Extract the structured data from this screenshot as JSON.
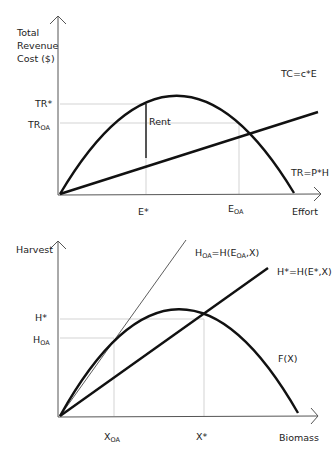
{
  "top_chart": {
    "y_axis_label": [
      "Total",
      "Revenue",
      "Cost ($)"
    ],
    "x_axis_label": "Effort",
    "y_ticks": {
      "tr_star": "TR*",
      "tr_oa_base": "TR",
      "tr_oa_sub": "OA"
    },
    "x_ticks": {
      "e_star": "E*",
      "e_oa_base": "E",
      "e_oa_sub": "OA"
    },
    "curve_labels": {
      "tc": "TC=c*E",
      "tr": "TR=P*H",
      "rent": "Rent"
    }
  },
  "bottom_chart": {
    "y_axis_label": "Harvest",
    "x_axis_label": "Biomass",
    "y_ticks": {
      "h_star": "H*",
      "h_oa_base": "H",
      "h_oa_sub": "OA"
    },
    "x_ticks": {
      "x_oa_base": "X",
      "x_oa_sub": "OA",
      "x_star": "X*"
    },
    "curve_labels": {
      "h_oa_lhs_base": "H",
      "h_oa_lhs_sub": "OA",
      "h_oa_mid": "=H(E",
      "h_oa_mid_sub": "OA",
      "h_oa_end": ",X)",
      "h_star": "H*=H(E*,X)",
      "growth": "F(X)"
    }
  },
  "colors": {
    "curve": "#111111",
    "guide": "#c8c8c8",
    "axis": "#555555",
    "rent": "#555555"
  }
}
